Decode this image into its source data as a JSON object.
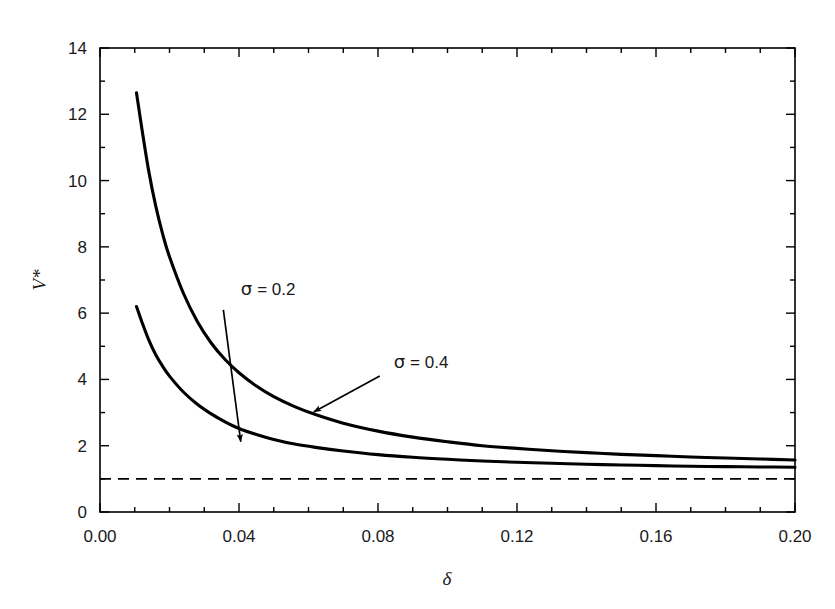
{
  "figure": {
    "partial_caption_top": "",
    "background_color": "#ffffff",
    "line_color": "#000000"
  },
  "chart_data": {
    "type": "line",
    "title": "",
    "xlabel": "δ",
    "ylabel": "V*",
    "xlim": [
      0.0,
      0.2
    ],
    "ylim": [
      0,
      14
    ],
    "grid": false,
    "legend": "none",
    "x_ticks": [
      0.0,
      0.04,
      0.08,
      0.12,
      0.16,
      0.2
    ],
    "x_tick_labels": [
      "0.00",
      "0.04",
      "0.08",
      "0.12",
      "0.16",
      "0.20"
    ],
    "x_minor_tick_step": 0.01,
    "y_ticks": [
      0,
      2,
      4,
      6,
      8,
      10,
      12,
      14
    ],
    "y_tick_labels": [
      "0",
      "2",
      "4",
      "6",
      "8",
      "10",
      "12",
      "14"
    ],
    "y_minor_tick_step": 1,
    "series": [
      {
        "name": "σ = 0.4",
        "style": "solid",
        "color": "#000000",
        "x": [
          0.0105,
          0.012,
          0.014,
          0.016,
          0.018,
          0.02,
          0.024,
          0.028,
          0.032,
          0.036,
          0.04,
          0.045,
          0.05,
          0.056,
          0.062,
          0.07,
          0.08,
          0.09,
          0.1,
          0.11,
          0.12,
          0.13,
          0.14,
          0.15,
          0.16,
          0.17,
          0.18,
          0.19,
          0.2
        ],
        "y": [
          12.65,
          11.6,
          10.3,
          9.25,
          8.4,
          7.7,
          6.6,
          5.75,
          5.1,
          4.6,
          4.2,
          3.8,
          3.48,
          3.18,
          2.94,
          2.68,
          2.44,
          2.26,
          2.12,
          2.0,
          1.92,
          1.85,
          1.79,
          1.74,
          1.7,
          1.66,
          1.63,
          1.6,
          1.57
        ]
      },
      {
        "name": "σ = 0.2",
        "style": "solid",
        "color": "#000000",
        "x": [
          0.0105,
          0.012,
          0.014,
          0.016,
          0.018,
          0.02,
          0.024,
          0.028,
          0.032,
          0.036,
          0.04,
          0.045,
          0.05,
          0.056,
          0.062,
          0.07,
          0.08,
          0.09,
          0.1,
          0.11,
          0.12,
          0.13,
          0.14,
          0.15,
          0.16,
          0.17,
          0.18,
          0.19,
          0.2
        ],
        "y": [
          6.2,
          5.75,
          5.2,
          4.75,
          4.4,
          4.1,
          3.62,
          3.25,
          2.96,
          2.72,
          2.52,
          2.34,
          2.19,
          2.05,
          1.95,
          1.84,
          1.73,
          1.65,
          1.59,
          1.54,
          1.5,
          1.47,
          1.44,
          1.42,
          1.4,
          1.38,
          1.37,
          1.36,
          1.35
        ]
      }
    ],
    "reference_line": {
      "name": "asymptote",
      "style": "dashed",
      "orientation": "horizontal",
      "y": 1.0,
      "color": "#000000"
    },
    "annotations": [
      {
        "label": "σ = 0.2",
        "symbol": "σ",
        "equals": "= 0.2",
        "text_x": 0.0405,
        "text_y": 6.55,
        "arrow_from": [
          0.0355,
          6.1
        ],
        "arrow_to": [
          0.0405,
          2.12
        ]
      },
      {
        "label": "σ = 0.4",
        "symbol": "σ",
        "equals": "= 0.4",
        "text_x": 0.0845,
        "text_y": 4.35,
        "arrow_from": [
          0.0805,
          4.1
        ],
        "arrow_to": [
          0.0615,
          3.02
        ]
      }
    ]
  }
}
